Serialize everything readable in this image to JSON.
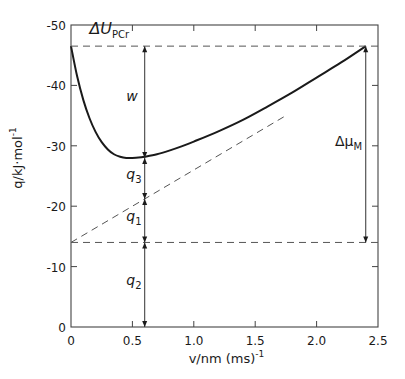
{
  "chart_data": {
    "type": "line",
    "title": "",
    "xlabel": "v/nm (ms)^-1",
    "ylabel": "q/kJ·mol^-1",
    "xlabel_parts": {
      "main": "v/nm (ms)",
      "sup": "-1"
    },
    "ylabel_parts": {
      "main": "q/kJ·mol",
      "sup": "-1"
    },
    "xlim": [
      0,
      2.5
    ],
    "ylim": [
      0,
      -50
    ],
    "x_ticks": [
      0,
      0.5,
      1.0,
      1.5,
      2.0,
      2.5
    ],
    "x_tick_labels": [
      "0",
      "0.5",
      "1.0",
      "1.5",
      "2.0",
      "2.5"
    ],
    "y_ticks": [
      0,
      -10,
      -20,
      -30,
      -40,
      -50
    ],
    "y_tick_labels": [
      "0",
      "-10",
      "-20",
      "-30",
      "-40",
      "-50"
    ],
    "grid": false,
    "legend": null,
    "series": [
      {
        "name": "heat curve",
        "style": "solid",
        "x": [
          0,
          0.05,
          0.1,
          0.15,
          0.2,
          0.25,
          0.3,
          0.35,
          0.4,
          0.45,
          0.5,
          0.55,
          0.6,
          0.7,
          0.8,
          0.9,
          1.0,
          1.2,
          1.4,
          1.6,
          1.8,
          2.0,
          2.2,
          2.4
        ],
        "values": [
          -46.5,
          -41.5,
          -37.6,
          -34.6,
          -32.3,
          -30.6,
          -29.4,
          -28.6,
          -28.2,
          -28.0,
          -28.0,
          -28.05,
          -28.2,
          -28.6,
          -29.2,
          -29.9,
          -30.7,
          -32.4,
          -34.3,
          -36.5,
          -38.8,
          -41.3,
          -43.8,
          -46.5
        ]
      },
      {
        "name": "tangent",
        "style": "dashed",
        "x": [
          0,
          1.75
        ],
        "values": [
          -14,
          -35
        ]
      },
      {
        "name": "ΔU_PCr level",
        "style": "dashed",
        "x": [
          0,
          2.5
        ],
        "values": [
          -46.5,
          -46.5
        ]
      },
      {
        "name": "lower level",
        "style": "dashed",
        "x": [
          0,
          2.5
        ],
        "values": [
          -14,
          -14
        ]
      }
    ],
    "annotations": [
      {
        "text": "ΔU",
        "sub": "PCr",
        "x": 0.15,
        "y": -48.5
      },
      {
        "text": "w",
        "x": 0.45,
        "y": -37.5,
        "arrow_range": [
          -46.5,
          -28
        ]
      },
      {
        "text": "q",
        "sub": "3",
        "x": 0.45,
        "y": -24.5,
        "arrow_range": [
          -28,
          -21.2
        ]
      },
      {
        "text": "q",
        "sub": "1",
        "x": 0.45,
        "y": -17.5,
        "arrow_range": [
          -21.2,
          -14
        ]
      },
      {
        "text": "q",
        "sub": "2",
        "x": 0.45,
        "y": -7,
        "arrow_range": [
          -14,
          0
        ]
      },
      {
        "text": "Δμ",
        "sub": "M",
        "x": 2.15,
        "y": -30,
        "arrow_range": [
          -46.5,
          -14
        ]
      }
    ],
    "vertical_arrow_x": 0.6,
    "right_arrow_x": 2.4
  }
}
